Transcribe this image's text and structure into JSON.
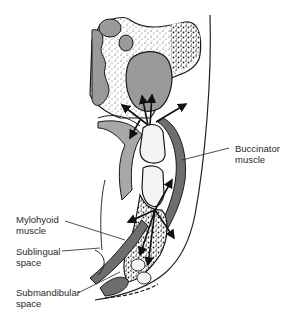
{
  "diagram": {
    "type": "anatomical-cross-section",
    "colors": {
      "outline": "#1a1a1a",
      "muscle_fill": "#6e6e6e",
      "sinus_fill": "#9a9a9a",
      "soft_tissue_fill": "#a8a8a8",
      "tooth_fill": "#f4f4f4",
      "bone_stipple": "#3a3a3a",
      "background": "#ffffff"
    },
    "labels": [
      {
        "id": "buccinator",
        "lines": [
          "Buccinator",
          "muscle"
        ]
      },
      {
        "id": "mylohyoid",
        "lines": [
          "Mylohyoid",
          "muscle"
        ]
      },
      {
        "id": "sublingual",
        "lines": [
          "Sublingual",
          "space"
        ]
      },
      {
        "id": "submandibular",
        "lines": [
          "Submandibular",
          "space"
        ]
      }
    ],
    "arrows": {
      "maxillary_count": 4,
      "mandibular_count": 5
    }
  }
}
